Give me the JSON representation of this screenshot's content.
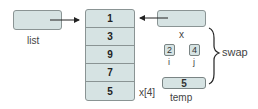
{
  "list": {
    "label": "list"
  },
  "array": {
    "cells": [
      "1",
      "3",
      "9",
      "7",
      "5"
    ],
    "index_label": "x[4]"
  },
  "x": {
    "label": "x"
  },
  "i": {
    "value": "2",
    "label": "i"
  },
  "j": {
    "value": "4",
    "label": "j"
  },
  "temp": {
    "value": "5",
    "label": "temp"
  },
  "brace": {
    "label": "swap"
  },
  "colors": {
    "box_fill": "#d6e3e3",
    "box_border": "#8a9494"
  }
}
